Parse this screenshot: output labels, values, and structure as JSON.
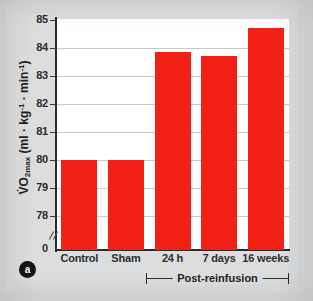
{
  "figure": {
    "panel_letter": "a",
    "bracket_label": "Post-reinfusion"
  },
  "chart_data": {
    "type": "bar",
    "title": "",
    "subtitle": "",
    "xlabel": "",
    "ylabel": "VO2max (ml · kg-1 · min-1)",
    "ylabel_parts": {
      "v_dot": "V",
      "o": "O",
      "subscript": "2max",
      "unit_open": " (ml · kg",
      "unit_sup1": "-1",
      "unit_mid": " · min",
      "unit_sup2": "-1",
      "unit_close": ")"
    },
    "categories": [
      "Control",
      "Sham",
      "24 h",
      "7 days",
      "16 weeks"
    ],
    "values": [
      80.0,
      80.0,
      83.85,
      83.7,
      84.7
    ],
    "ylim": [
      78,
      85
    ],
    "y_axis_break": true,
    "y_zero_label": "0",
    "yticks": [
      78,
      79,
      80,
      81,
      82,
      83,
      84,
      85
    ],
    "ytick_labels": [
      "78",
      "79",
      "80",
      "81",
      "82",
      "83",
      "84",
      "85"
    ],
    "grid": true,
    "grid_axis": "y",
    "legend": null,
    "legend_position": "none",
    "bar_color": "#f22015",
    "bracket_categories": [
      "24 h",
      "7 days",
      "16 weeks"
    ],
    "bracket_label": "Post-reinfusion"
  },
  "colors": {
    "bar": "#f22015",
    "axis": "#2a2a2a",
    "grid": "#c9cacc",
    "plot_background": "#ffffff",
    "page_background": "#d9dadc",
    "text": "#1f1f1f"
  }
}
